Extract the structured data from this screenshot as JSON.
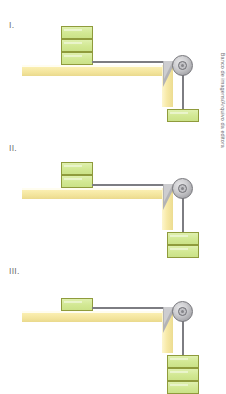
{
  "top_caption": "",
  "credit": "Banco de imagens/Arquivo da editora",
  "figures": [
    {
      "label": "I.",
      "blocks_on_table": 3,
      "blocks_hanging": 1
    },
    {
      "label": "II.",
      "blocks_on_table": 2,
      "blocks_hanging": 2
    },
    {
      "label": "III.",
      "blocks_on_table": 1,
      "blocks_hanging": 3
    }
  ],
  "elements": {
    "table_name": "table",
    "pulley_name": "pulley",
    "string_name": "string",
    "block_name": "block"
  },
  "colors": {
    "block_fill": "#d2e893",
    "block_border": "#8f9b3c",
    "table_fill": "#f7e9a6",
    "pulley_gray": "#adadb1",
    "string_gray": "#7d7d82",
    "label_text": "#6b6b6e"
  }
}
